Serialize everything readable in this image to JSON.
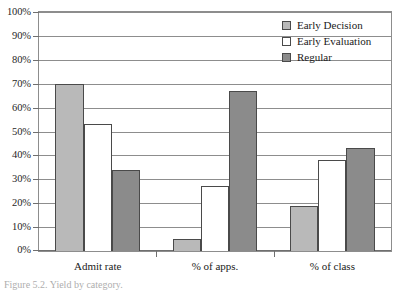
{
  "figure": {
    "caption": "Figure 5.2. Yield by category."
  },
  "chart_data": {
    "type": "bar",
    "title": "",
    "xlabel": "",
    "ylabel": "",
    "categories": [
      "Admit rate",
      "% of apps.",
      "% of class"
    ],
    "series": [
      {
        "name": "Early Decision",
        "color": "#b9b9b9",
        "values": [
          70,
          5,
          19
        ]
      },
      {
        "name": "Early Evaluation",
        "color": "#ffffff",
        "values": [
          53,
          27,
          38
        ]
      },
      {
        "name": "Regular",
        "color": "#8b8b8b",
        "values": [
          34,
          67,
          43
        ]
      }
    ],
    "ylim": [
      0,
      100
    ],
    "ytick_values": [
      0,
      10,
      20,
      30,
      40,
      50,
      60,
      70,
      80,
      90,
      100
    ],
    "ytick_labels": [
      "0%",
      "10%",
      "20%",
      "30%",
      "40%",
      "50%",
      "60%",
      "70%",
      "80%",
      "90%",
      "100%"
    ],
    "grid": true,
    "legend_position": "upper right inside"
  }
}
